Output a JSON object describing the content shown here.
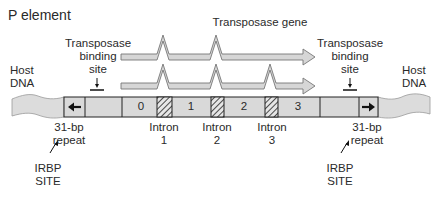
{
  "title": "P element",
  "gene_label": "Transposase gene",
  "binding_site_left": {
    "line1": "Transposase",
    "line2": "binding",
    "line3": "site"
  },
  "binding_site_right": {
    "line1": "Transposase",
    "line2": "binding",
    "line3": "site"
  },
  "host_dna_left": {
    "line1": "Host",
    "line2": "DNA"
  },
  "host_dna_right": {
    "line1": "Host",
    "line2": "DNA"
  },
  "exons": [
    "0",
    "1",
    "2",
    "3"
  ],
  "introns": [
    {
      "line1": "Intron",
      "line2": "1"
    },
    {
      "line1": "Intron",
      "line2": "2"
    },
    {
      "line1": "Intron",
      "line2": "3"
    }
  ],
  "repeat_left": {
    "line1": "31-bp",
    "line2": "repeat"
  },
  "repeat_right": {
    "line1": "31-bp",
    "line2": "repeat"
  },
  "irbp_left": {
    "line1": "IRBP",
    "line2": "SITE"
  },
  "irbp_right": {
    "line1": "IRBP",
    "line2": "SITE"
  },
  "colors": {
    "fill": "#d9d9d9",
    "stroke": "#222222",
    "arrow_fill": "#d6d6d6"
  }
}
